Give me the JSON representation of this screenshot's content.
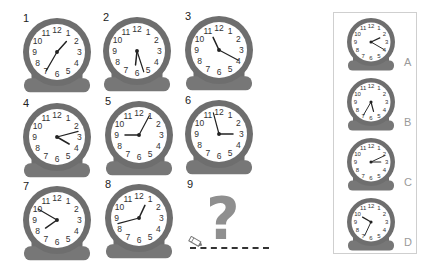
{
  "puzzle": {
    "clocks": [
      {
        "label": "1",
        "cx": 57,
        "cy": 52,
        "minute_angle": 210,
        "hour_angle": 42
      },
      {
        "label": "2",
        "cx": 137,
        "cy": 51,
        "minute_angle": 162,
        "hour_angle": 186
      },
      {
        "label": "3",
        "cx": 219,
        "cy": 50,
        "minute_angle": 118,
        "hour_angle": 335
      },
      {
        "label": "4",
        "cx": 57,
        "cy": 137,
        "minute_angle": 75,
        "hour_angle": 120
      },
      {
        "label": "5",
        "cx": 139,
        "cy": 135,
        "minute_angle": 28,
        "hour_angle": 270
      },
      {
        "label": "6",
        "cx": 219,
        "cy": 134,
        "minute_angle": 345,
        "hour_angle": 90
      },
      {
        "label": "7",
        "cx": 57,
        "cy": 220,
        "minute_angle": 300,
        "hour_angle": 235
      },
      {
        "label": "8",
        "cx": 139,
        "cy": 218,
        "minute_angle": 255,
        "hour_angle": 25
      }
    ],
    "missing": {
      "label": "9",
      "symbol": "?"
    }
  },
  "options": {
    "items": [
      {
        "label": "A",
        "cy": 42,
        "minute_angle": 120,
        "hour_angle": 65
      },
      {
        "label": "B",
        "cy": 102,
        "minute_angle": 210,
        "hour_angle": 165
      },
      {
        "label": "C",
        "cy": 162,
        "minute_angle": 65,
        "hour_angle": 90
      },
      {
        "label": "D",
        "cy": 222,
        "minute_angle": 205,
        "hour_angle": 300
      }
    ]
  },
  "colors": {
    "ring": "#6e6e6e",
    "base": "#777777",
    "face": "#ffffff",
    "hand": "#222222",
    "question": "#8f8f8f",
    "panel_border": "#cfcfcf",
    "option_label": "#9a9a9a"
  },
  "dial_numbers": [
    "12",
    "1",
    "2",
    "3",
    "4",
    "5",
    "6",
    "7",
    "8",
    "9",
    "10",
    "11"
  ]
}
